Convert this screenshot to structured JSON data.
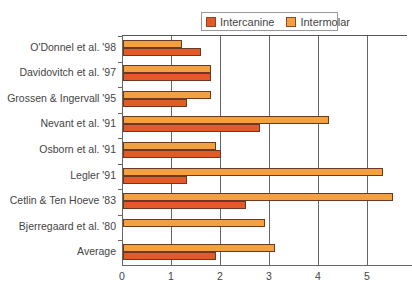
{
  "legend": [
    {
      "label": "Intercanine",
      "color": "#e25a28"
    },
    {
      "label": "Intermolar",
      "color": "#f2a040"
    }
  ],
  "chart_data": {
    "type": "bar",
    "orientation": "horizontal",
    "title": "",
    "xlabel": "",
    "ylabel": "",
    "categories": [
      "O'Donnel et al. '98",
      "Davidovitch et al. '97",
      "Grossen & Ingervall '95",
      "Nevant et al. '91",
      "Osborn et al. '91",
      "Legler '91",
      "Cetlin & Ten Hoeve '83",
      "Bjerregaard et al. '80",
      "Average"
    ],
    "series": [
      {
        "name": "Intercanine",
        "color": "#e25a28",
        "values": [
          1.6,
          1.8,
          1.3,
          2.8,
          2.0,
          1.3,
          2.5,
          0,
          1.9
        ]
      },
      {
        "name": "Intermolar",
        "color": "#f2a040",
        "values": [
          1.2,
          1.8,
          1.8,
          4.2,
          1.9,
          5.3,
          5.5,
          2.9,
          3.1
        ]
      }
    ],
    "xlim": [
      0,
      5.5
    ],
    "xticks": [
      "0",
      "1",
      "2",
      "3",
      "4",
      "5"
    ],
    "grid": true,
    "legend_position": "top-right"
  }
}
